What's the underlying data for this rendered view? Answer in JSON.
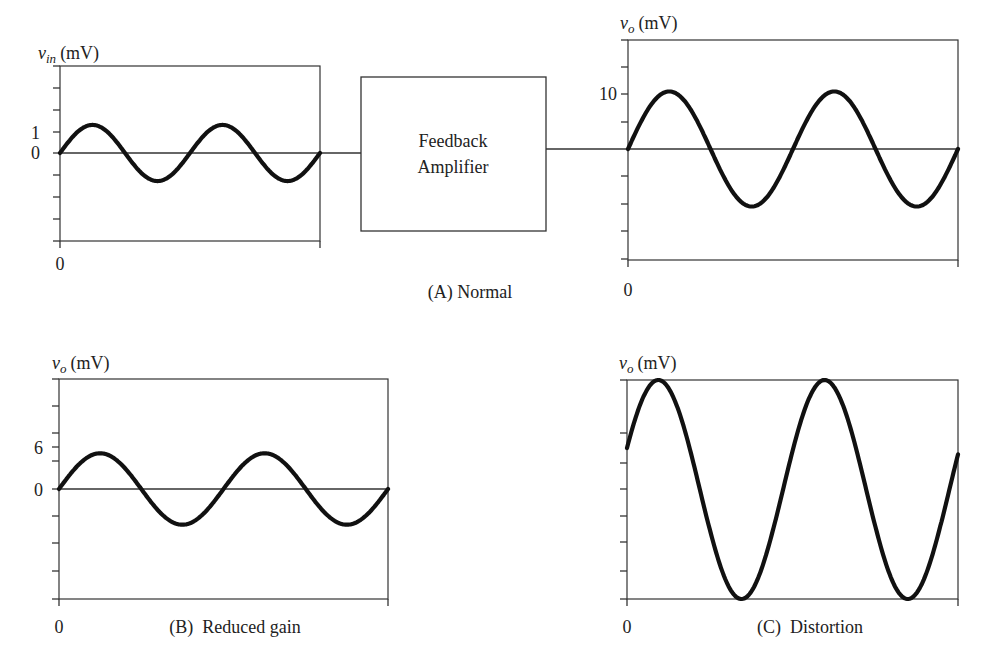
{
  "figure": {
    "block": {
      "line1": "Feedback",
      "line2": "Amplifier"
    },
    "panels": {
      "a_input": {
        "ylabel_var": "v",
        "ylabel_sub": "in",
        "ylabel_unit": "(mV)",
        "yticks": [
          "1",
          "0"
        ],
        "xtick": "0"
      },
      "a_output": {
        "ylabel_var": "v",
        "ylabel_sub": "o",
        "ylabel_unit": "(mV)",
        "yticks": [
          "10"
        ],
        "xtick": "0"
      },
      "b": {
        "ylabel_var": "v",
        "ylabel_sub": "o",
        "ylabel_unit": "(mV)",
        "yticks": [
          "6",
          "0"
        ],
        "xtick": "0"
      },
      "c": {
        "ylabel_var": "v",
        "ylabel_sub": "o",
        "ylabel_unit": "(mV)",
        "xtick": "0"
      }
    },
    "captions": {
      "a": "(A) Normal",
      "b": "(B)  Reduced gain",
      "c": "(C)  Distortion"
    }
  },
  "chart_data": [
    {
      "type": "line",
      "title": "(A) Normal — input",
      "xlabel": "",
      "ylabel": "v_in (mV)",
      "x_ticks": [
        "0"
      ],
      "y_ticks": [
        1,
        0
      ],
      "ylim": [
        -4,
        4
      ],
      "cycles": 2,
      "series": [
        {
          "name": "v_in",
          "amplitude_mV": 1.3,
          "waveform": "sine"
        }
      ],
      "grid": false
    },
    {
      "type": "line",
      "title": "(A) Normal — output",
      "xlabel": "",
      "ylabel": "v_o (mV)",
      "x_ticks": [
        "0"
      ],
      "y_ticks": [
        10
      ],
      "ylim": [
        -20,
        20
      ],
      "cycles": 2,
      "series": [
        {
          "name": "v_o",
          "amplitude_mV": 10.5,
          "waveform": "sine"
        }
      ],
      "grid": false
    },
    {
      "type": "line",
      "title": "(B) Reduced gain",
      "xlabel": "",
      "ylabel": "v_o (mV)",
      "x_ticks": [
        "0"
      ],
      "y_ticks": [
        6,
        0
      ],
      "ylim": [
        -12,
        12
      ],
      "cycles": 2,
      "series": [
        {
          "name": "v_o",
          "amplitude_mV": 5.1,
          "waveform": "sine"
        }
      ],
      "grid": false
    },
    {
      "type": "line",
      "title": "(C) Distortion",
      "xlabel": "",
      "ylabel": "v_o (mV)",
      "x_ticks": [
        "0"
      ],
      "y_ticks": [],
      "cycles": 2,
      "series": [
        {
          "name": "v_o",
          "waveform": "sine with DC offset, clipped at top and bottom of range"
        }
      ],
      "grid": false
    }
  ]
}
